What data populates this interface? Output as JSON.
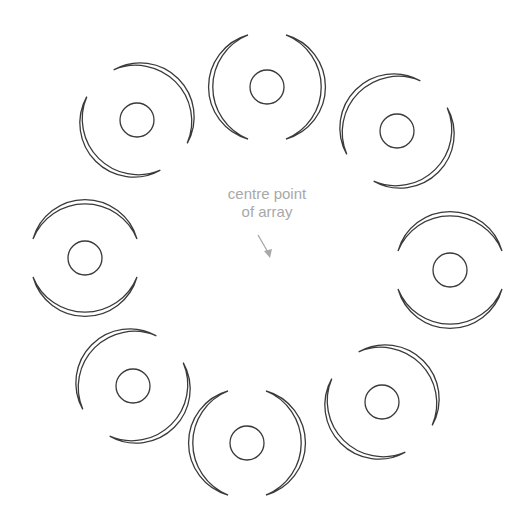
{
  "diagram": {
    "centre_label": {
      "line1": "centre point",
      "line2": "of array"
    },
    "stroke_color": "#3a3a3a",
    "label_color": "#a8a8a8",
    "array": {
      "centre": [
        266,
        265
      ],
      "radius": 182,
      "count": 8
    },
    "elements": [
      {
        "name": "element-top",
        "cx": 267,
        "cy": 87,
        "angle": 0
      },
      {
        "name": "element-top-right",
        "cx": 397,
        "cy": 131,
        "angle": 45
      },
      {
        "name": "element-right",
        "cx": 450,
        "cy": 270,
        "angle": 90
      },
      {
        "name": "element-bottom-right",
        "cx": 382,
        "cy": 402,
        "angle": 135
      },
      {
        "name": "element-bottom",
        "cx": 247,
        "cy": 443,
        "angle": 180
      },
      {
        "name": "element-bottom-left",
        "cx": 133,
        "cy": 386,
        "angle": 225
      },
      {
        "name": "element-left",
        "cx": 85,
        "cy": 258,
        "angle": 270
      },
      {
        "name": "element-top-left",
        "cx": 137,
        "cy": 120,
        "angle": 315
      }
    ]
  }
}
